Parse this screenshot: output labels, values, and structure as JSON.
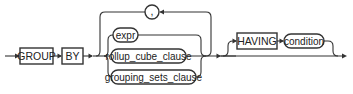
{
  "diagram": {
    "type": "syntax-railroad",
    "colors": {
      "stroke": "#333333",
      "text": "#222222",
      "background": "#ffffff"
    },
    "keywords": [
      {
        "id": "group",
        "label": "GROUP",
        "shape": "rectangle"
      },
      {
        "id": "by",
        "label": "BY",
        "shape": "rectangle"
      },
      {
        "id": "having",
        "label": "HAVING",
        "shape": "rectangle"
      }
    ],
    "loop": {
      "separator": {
        "label": ",",
        "shape": "circle"
      },
      "branches": [
        {
          "id": "expr",
          "label": "expr",
          "shape": "rounded"
        },
        {
          "id": "rollup_cube_clause",
          "label": "rollup_cube_clause",
          "shape": "rounded"
        },
        {
          "id": "grouping_sets_clause",
          "label": "grouping_sets_clause",
          "shape": "rounded"
        }
      ]
    },
    "optional": {
      "keyword": "HAVING",
      "term": {
        "id": "condition",
        "label": "condition",
        "shape": "rounded"
      }
    }
  }
}
